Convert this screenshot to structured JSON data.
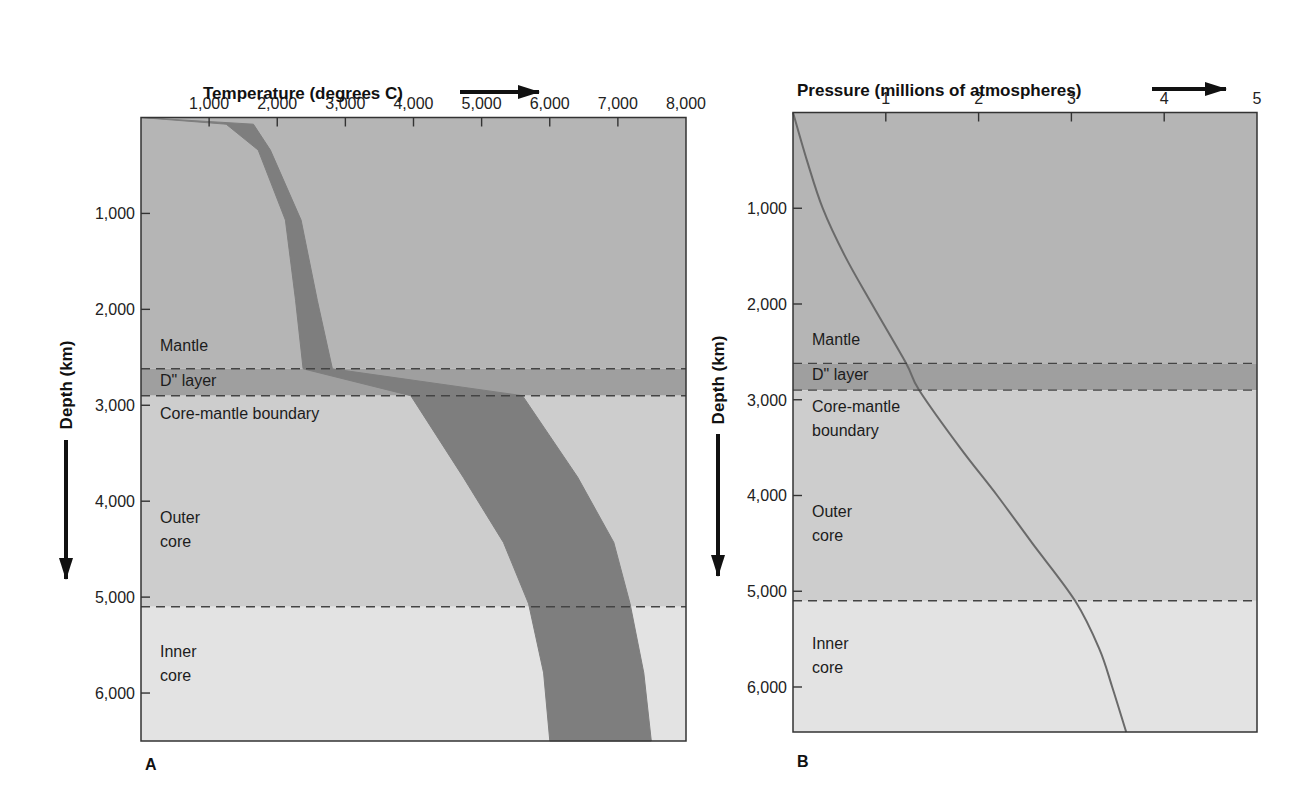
{
  "colors": {
    "mantle": "#b5b5b5",
    "d_layer": "#9f9f9f",
    "outer_core": "#cdcdcd",
    "inner_core": "#e3e3e3",
    "band": "#7e7e7e",
    "curve": "#6a6a6a",
    "frame": "#333333",
    "dash": "#444444",
    "text": "#1a1a1a"
  },
  "chart_data": [
    {
      "id": "A",
      "type": "area",
      "panel_label": "A",
      "title": "",
      "xlabel": "Temperature (degrees C)",
      "ylabel": "Depth (km)",
      "x_axis_position": "top",
      "y_axis_inverted": true,
      "xlim": [
        0,
        8000
      ],
      "ylim": [
        0,
        6500
      ],
      "x_ticks": [
        1000,
        2000,
        3000,
        4000,
        5000,
        6000,
        7000,
        8000
      ],
      "x_tick_labels": [
        "1,000",
        "2,000",
        "3,000",
        "4,000",
        "5,000",
        "6,000",
        "7,000",
        "8,000"
      ],
      "y_ticks": [
        1000,
        2000,
        3000,
        4000,
        5000,
        6000
      ],
      "y_tick_labels": [
        "1,000",
        "2,000",
        "3,000",
        "4,000",
        "5,000",
        "6,000"
      ],
      "grid": false,
      "layers": [
        {
          "name": "Mantle",
          "label_lines": [
            "Mantle"
          ],
          "top": 0,
          "bottom": 2620,
          "label_depth": 2430
        },
        {
          "name": "D\" layer",
          "label_lines": [
            "D\" layer"
          ],
          "top": 2620,
          "bottom": 2900,
          "label_depth": 2800
        },
        {
          "name": "Core-mantle boundary",
          "label_lines": [
            "Core-mantle boundary"
          ],
          "top": 2900,
          "bottom": 5100,
          "label_depth": 3140
        },
        {
          "name": "Outer core",
          "label_lines": [
            "Outer",
            "core"
          ],
          "top": 2900,
          "bottom": 5100,
          "label_depth": 4230
        },
        {
          "name": "Inner core",
          "label_lines": [
            "Inner",
            "core"
          ],
          "top": 5100,
          "bottom": 6500,
          "label_depth": 5620
        }
      ],
      "boundaries_dashed": [
        2620,
        2900,
        5100
      ],
      "series": [
        {
          "name": "Temperature range",
          "depth": [
            0,
            70,
            340,
            1070,
            1910,
            2620,
            2900,
            3750,
            4430,
            5070,
            5790,
            6500
          ],
          "min": [
            0,
            1250,
            1720,
            2120,
            2270,
            2380,
            3960,
            4730,
            5320,
            5690,
            5910,
            6000
          ],
          "max": [
            0,
            1650,
            1900,
            2350,
            2590,
            2810,
            5600,
            6410,
            6940,
            7180,
            7380,
            7490
          ]
        }
      ]
    },
    {
      "id": "B",
      "type": "line",
      "panel_label": "B",
      "title": "",
      "xlabel": "Pressure (millions of atmospheres)",
      "ylabel": "Depth (km)",
      "x_axis_position": "top",
      "y_axis_inverted": true,
      "xlim": [
        0,
        5
      ],
      "ylim": [
        0,
        6470
      ],
      "x_ticks": [
        1,
        2,
        3,
        4,
        5
      ],
      "x_tick_labels": [
        "1",
        "2",
        "3",
        "4",
        "5"
      ],
      "y_ticks": [
        1000,
        2000,
        3000,
        4000,
        5000,
        6000
      ],
      "y_tick_labels": [
        "1,000",
        "2,000",
        "3,000",
        "4,000",
        "5,000",
        "6,000"
      ],
      "grid": false,
      "layers": [
        {
          "name": "Mantle",
          "label_lines": [
            "Mantle"
          ],
          "top": 0,
          "bottom": 2620,
          "label_depth": 2430
        },
        {
          "name": "D\" layer",
          "label_lines": [
            "D\" layer"
          ],
          "top": 2620,
          "bottom": 2900,
          "label_depth": 2790
        },
        {
          "name": "Core-mantle boundary",
          "label_lines": [
            "Core-mantle",
            "boundary"
          ],
          "top": 2900,
          "bottom": 5100,
          "label_depth": 3130
        },
        {
          "name": "Outer core",
          "label_lines": [
            "Outer",
            "core"
          ],
          "top": 2900,
          "bottom": 5100,
          "label_depth": 4220
        },
        {
          "name": "Inner core",
          "label_lines": [
            "Inner",
            "core"
          ],
          "top": 5100,
          "bottom": 6470,
          "label_depth": 5600
        }
      ],
      "boundaries_dashed": [
        2620,
        2900,
        5100
      ],
      "series": [
        {
          "name": "Pressure",
          "depth": [
            0,
            500,
            1000,
            1500,
            2000,
            2620,
            2900,
            3500,
            4000,
            4500,
            5100,
            5600,
            6000,
            6470
          ],
          "pressure": [
            0,
            0.15,
            0.32,
            0.56,
            0.85,
            1.22,
            1.36,
            1.8,
            2.2,
            2.58,
            3.04,
            3.3,
            3.44,
            3.59
          ]
        }
      ]
    }
  ],
  "panels": {
    "A": {
      "x_axis_title": "Temperature (degrees C)",
      "y_axis_title": "Depth (km)",
      "letter": "A"
    },
    "B": {
      "x_axis_title": "Pressure (millions of atmospheres)",
      "y_axis_title": "Depth (km)",
      "letter": "B"
    }
  }
}
